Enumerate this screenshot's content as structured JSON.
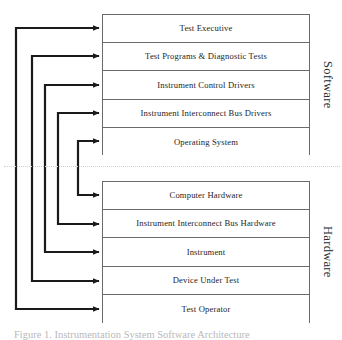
{
  "figure": {
    "caption": "Figure 1. Instrumentation System Software Architecture",
    "divider_style": "dotted"
  },
  "sections": [
    {
      "id": "software",
      "caption": "Software",
      "layers": [
        {
          "label": "Test Executive"
        },
        {
          "label": "Test Programs & Diagnostic Tests"
        },
        {
          "label": "Instrument Control Drivers"
        },
        {
          "label": "Instrument Interconnect Bus Drivers"
        },
        {
          "label": "Operating System"
        }
      ]
    },
    {
      "id": "hardware",
      "caption": "Hardware",
      "layers": [
        {
          "label": "Computer Hardware"
        },
        {
          "label": "Instrument Interconnect Bus Hardware"
        },
        {
          "label": "Instrument"
        },
        {
          "label": "Device Under Test"
        },
        {
          "label": "Test Operator"
        }
      ]
    }
  ],
  "connectors": [
    {
      "name": "test-executive-to-test-operator",
      "from": "Test Executive",
      "to": "Test Operator",
      "bracket_x": 16
    },
    {
      "name": "test-programs-to-device-under-test",
      "from": "Test Programs & Diagnostic Tests",
      "to": "Device Under Test",
      "bracket_x": 32
    },
    {
      "name": "instrument-control-drivers-to-instrument",
      "from": "Instrument Control Drivers",
      "to": "Instrument",
      "bracket_x": 45
    },
    {
      "name": "bus-drivers-to-bus-hardware",
      "from": "Instrument Interconnect Bus Drivers",
      "to": "Instrument Interconnect Bus Hardware",
      "bracket_x": 58
    },
    {
      "name": "operating-system-to-computer-hardware",
      "from": "Operating System",
      "to": "Computer Hardware",
      "bracket_x": 78
    }
  ],
  "colors": {
    "line": "#1a1a1a",
    "box_border": "#6a6a6a",
    "text": "#252525",
    "divider": "#cfcfcf",
    "background": "#ffffff"
  }
}
